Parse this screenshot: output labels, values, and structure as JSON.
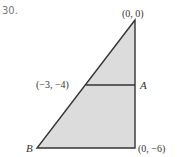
{
  "problem": {
    "number": "30."
  },
  "figure": {
    "fill_color": "#dcdcdc",
    "stroke_color": "#333333",
    "labels": {
      "top": "(0, 0)",
      "mid_left": "(−3, −4)",
      "mid_right": "A",
      "bottom_left": "B",
      "bottom_right": "(0, −6)"
    }
  }
}
